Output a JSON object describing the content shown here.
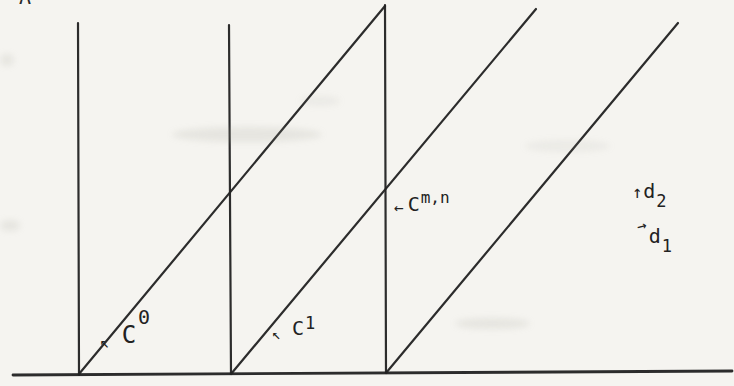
{
  "figure": {
    "background": "#f5f4f0",
    "ink": "#222222",
    "partial_top_glyph": "A",
    "labels": {
      "c0": {
        "arrow": "↖",
        "base": "C",
        "sup": "0"
      },
      "c1": {
        "arrow": "↖",
        "base": "C",
        "sup": "1"
      },
      "cmn": {
        "arrow": "←",
        "base": "C",
        "sup": "m,n"
      },
      "d2": {
        "arrow": "↑",
        "base": "d",
        "sub": "2"
      },
      "d1": {
        "arrow": "→",
        "base": "d",
        "sub": "1"
      }
    },
    "geometry": {
      "baseline": {
        "x1": 13,
        "y1": 375,
        "x2": 732,
        "y2": 371,
        "width": 2.8
      },
      "verticals": [
        {
          "x1": 78,
          "y1": 23,
          "x2": 79,
          "y2": 375,
          "width": 2.2
        },
        {
          "x1": 229,
          "y1": 25,
          "x2": 231,
          "y2": 374,
          "width": 2.2
        },
        {
          "x1": 385,
          "y1": 5,
          "x2": 386,
          "y2": 373,
          "width": 2.2
        }
      ],
      "diagonals": [
        {
          "x1": 79,
          "y1": 374,
          "x2": 385,
          "y2": 6,
          "width": 2.2
        },
        {
          "x1": 231,
          "y1": 374,
          "x2": 536,
          "y2": 9,
          "width": 2.2
        },
        {
          "x1": 386,
          "y1": 373,
          "x2": 678,
          "y2": 23,
          "width": 2.2
        }
      ]
    }
  }
}
